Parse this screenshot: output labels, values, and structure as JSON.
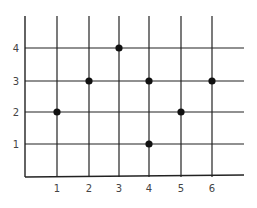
{
  "chart_data": {
    "type": "scatter",
    "title": "",
    "xlabel": "",
    "ylabel": "",
    "x_ticks": [
      "1",
      "2",
      "3",
      "4",
      "5",
      "6"
    ],
    "y_ticks": [
      "1",
      "2",
      "3",
      "4"
    ],
    "xlim": [
      0,
      6.9
    ],
    "ylim": [
      0,
      5
    ],
    "grid": true,
    "legend": null,
    "series": [
      {
        "name": "points",
        "points": [
          {
            "x": 1,
            "y": 2
          },
          {
            "x": 2,
            "y": 3
          },
          {
            "x": 3,
            "y": 4
          },
          {
            "x": 4,
            "y": 3
          },
          {
            "x": 4,
            "y": 1
          },
          {
            "x": 5,
            "y": 2
          },
          {
            "x": 6,
            "y": 3
          }
        ]
      }
    ],
    "colors": {
      "line": "#222222",
      "point": "#111111",
      "label": "#444444"
    }
  }
}
